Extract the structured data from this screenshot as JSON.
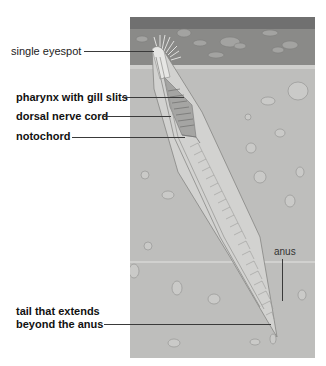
{
  "figure": {
    "colors": {
      "water": "#8a8a88",
      "water_top": "#6e6e6c",
      "sediment": "#bdbdbb",
      "label_line": "#3a3a3a"
    }
  },
  "labels": {
    "eyespot": "single eyespot",
    "pharynx": "pharynx with gill slits",
    "nerve_cord": "dorsal nerve cord",
    "notochord": "notochord",
    "tail_line1": "tail that extends",
    "tail_line2": "beyond the anus",
    "anus": "anus"
  }
}
